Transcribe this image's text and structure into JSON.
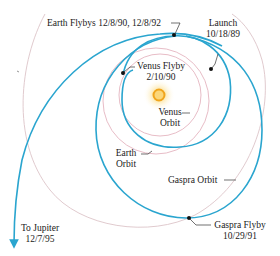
{
  "diagram": {
    "colors": {
      "trajectory": "#2aa5cf",
      "planet_orbit": "#e4b4c0",
      "gaspra_orbit": "#dcc4c8",
      "leader_line": "#333333",
      "sun_core": "#f2a91e",
      "sun_glow": "#fde8a6",
      "text": "#1a1a1a"
    },
    "labels": {
      "earth_flybys": "Earth Flybys 12/8/90, 12/8/92",
      "launch_title": "Launch",
      "launch_date": "10/18/89",
      "venus_flyby_title": "Venus Flyby",
      "venus_flyby_date": "2/10/90",
      "venus_orbit_line1": "Venus",
      "venus_orbit_line2": "Orbit",
      "earth_orbit_line1": "Earth",
      "earth_orbit_line2": "Orbit",
      "gaspra_orbit": "Gaspra Orbit",
      "gaspra_flyby_title": "Gaspra Flyby",
      "gaspra_flyby_date": "10/29/91",
      "to_jupiter_title": "To Jupiter",
      "to_jupiter_date": "12/7/95"
    },
    "events": [
      {
        "name": "Launch",
        "date": "10/18/89"
      },
      {
        "name": "Venus Flyby",
        "date": "2/10/90"
      },
      {
        "name": "Earth Flyby",
        "date": "12/8/90"
      },
      {
        "name": "Gaspra Flyby",
        "date": "10/29/91"
      },
      {
        "name": "Earth Flyby",
        "date": "12/8/92"
      },
      {
        "name": "To Jupiter",
        "date": "12/7/95"
      }
    ]
  }
}
